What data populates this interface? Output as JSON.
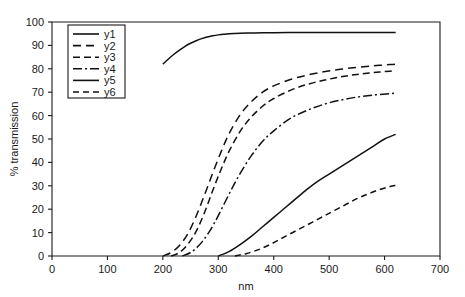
{
  "chart_data": {
    "type": "line",
    "title": "",
    "xlabel": "nm",
    "ylabel": "% transmission",
    "xlim": [
      0,
      700
    ],
    "ylim": [
      0,
      100
    ],
    "xticks": [
      0,
      100,
      200,
      300,
      400,
      500,
      600,
      700
    ],
    "yticks": [
      0,
      10,
      20,
      30,
      40,
      50,
      60,
      70,
      80,
      90,
      100
    ],
    "xtick_labels": [
      "0",
      "100",
      "200",
      "300",
      "400",
      "500",
      "600",
      "700"
    ],
    "ytick_labels": [
      "0",
      "10",
      "20",
      "30",
      "40",
      "50",
      "60",
      "70",
      "80",
      "90",
      "100"
    ],
    "grid": false,
    "legend_position": "upper left",
    "series": [
      {
        "name": "y1",
        "style": "solid",
        "dash": "none",
        "color": "#111111",
        "x": [
          200,
          210,
          220,
          230,
          240,
          250,
          260,
          270,
          280,
          290,
          300,
          310,
          320,
          340,
          360,
          380,
          400,
          440,
          480,
          520,
          560,
          600,
          620
        ],
        "y": [
          82.0,
          84.2,
          86.2,
          88.0,
          89.6,
          90.9,
          92.0,
          92.9,
          93.6,
          94.1,
          94.5,
          94.8,
          95.0,
          95.2,
          95.3,
          95.4,
          95.4,
          95.5,
          95.5,
          95.5,
          95.5,
          95.5,
          95.5
        ]
      },
      {
        "name": "y2",
        "style": "dashed",
        "dash": "8,5",
        "color": "#111111",
        "x": [
          200,
          215,
          230,
          245,
          260,
          275,
          290,
          305,
          320,
          340,
          360,
          380,
          400,
          430,
          460,
          490,
          520,
          550,
          580,
          610,
          620
        ],
        "y": [
          0.0,
          1.5,
          4.5,
          9.5,
          17.0,
          26.0,
          35.5,
          44.5,
          52.5,
          60.5,
          66.0,
          70.0,
          72.7,
          75.4,
          77.3,
          78.7,
          79.8,
          80.6,
          81.3,
          81.8,
          82.0
        ]
      },
      {
        "name": "y3",
        "style": "dashed",
        "dash": "7,4",
        "color": "#111111",
        "x": [
          215,
          230,
          245,
          260,
          275,
          290,
          305,
          320,
          340,
          360,
          380,
          400,
          430,
          460,
          490,
          520,
          550,
          580,
          610,
          620
        ],
        "y": [
          0.0,
          1.5,
          5.0,
          10.5,
          18.5,
          28.0,
          37.0,
          45.0,
          53.5,
          59.5,
          64.0,
          67.3,
          70.8,
          73.3,
          75.1,
          76.5,
          77.6,
          78.4,
          79.0,
          79.2
        ]
      },
      {
        "name": "y4",
        "style": "dash-dot",
        "dash": "9,3,2,3",
        "color": "#111111",
        "x": [
          235,
          250,
          265,
          280,
          295,
          310,
          325,
          340,
          360,
          380,
          400,
          430,
          460,
          490,
          520,
          550,
          580,
          610,
          620
        ],
        "y": [
          0.0,
          1.5,
          4.5,
          9.0,
          15.0,
          22.0,
          29.0,
          35.5,
          43.0,
          49.0,
          53.5,
          58.8,
          62.2,
          64.8,
          66.6,
          67.9,
          68.8,
          69.4,
          69.6
        ]
      },
      {
        "name": "y5",
        "style": "solid",
        "dash": "none",
        "color": "#111111",
        "x": [
          300,
          320,
          340,
          360,
          380,
          400,
          420,
          440,
          460,
          480,
          500,
          520,
          540,
          560,
          580,
          600,
          620
        ],
        "y": [
          0.0,
          2.0,
          5.0,
          8.5,
          12.5,
          16.5,
          20.5,
          24.5,
          28.5,
          32.0,
          35.0,
          38.0,
          41.0,
          44.0,
          47.0,
          50.0,
          52.0
        ]
      },
      {
        "name": "y6",
        "style": "dashed",
        "dash": "6,4",
        "color": "#111111",
        "x": [
          330,
          350,
          370,
          390,
          410,
          430,
          450,
          470,
          490,
          510,
          530,
          550,
          570,
          590,
          610,
          620
        ],
        "y": [
          0.0,
          1.0,
          2.5,
          4.5,
          7.0,
          9.5,
          12.0,
          14.5,
          17.0,
          19.5,
          22.0,
          24.5,
          26.5,
          28.3,
          29.7,
          30.2
        ]
      }
    ]
  },
  "axes": {
    "xlabel": "nm",
    "ylabel": "% transmission"
  },
  "legend": {
    "items": [
      {
        "label": "y1"
      },
      {
        "label": "y2"
      },
      {
        "label": "y3"
      },
      {
        "label": "y4"
      },
      {
        "label": "y5"
      },
      {
        "label": "y6"
      }
    ]
  }
}
